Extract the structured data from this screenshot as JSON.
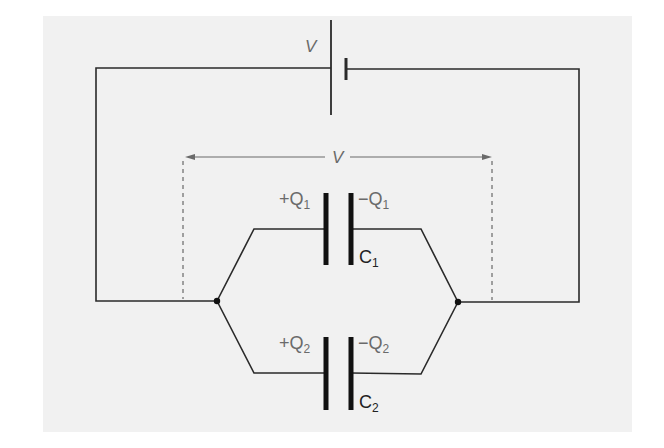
{
  "diagram": {
    "type": "circuit",
    "colors": {
      "background": "#f1f1f1",
      "wire": "#2a2a2a",
      "label": "#6a6a6a",
      "dashed": "#8a8a8a"
    },
    "battery": {
      "label": "V"
    },
    "voltage_span": {
      "label": "V"
    },
    "capacitors": [
      {
        "name": "C",
        "subscript": "1",
        "plus_charge": "+Q",
        "minus_charge": "−Q",
        "charge_subscript": "1"
      },
      {
        "name": "C",
        "subscript": "2",
        "plus_charge": "+Q",
        "minus_charge": "−Q",
        "charge_subscript": "2"
      }
    ]
  }
}
